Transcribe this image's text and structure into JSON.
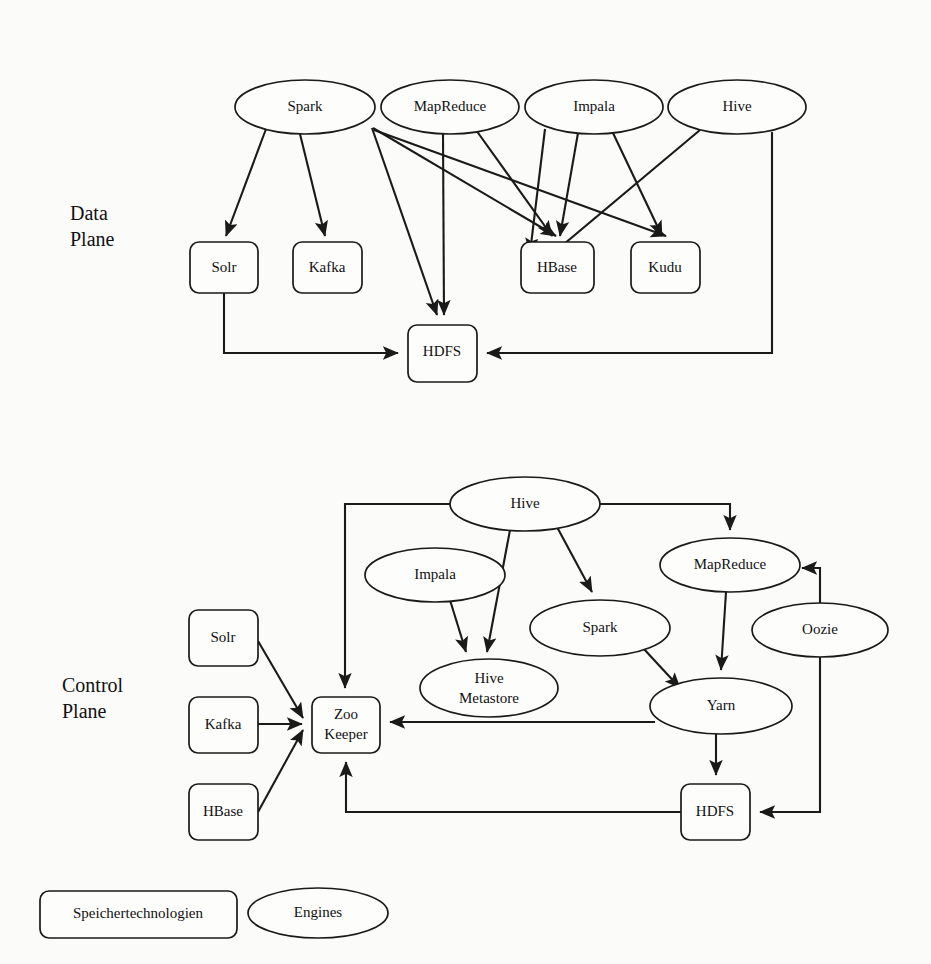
{
  "diagram": {
    "background_color": "#fbfbfa",
    "stroke_color": "#1a1a1a",
    "fill_color": "#fdfdfc"
  },
  "planes": [
    {
      "id": "data-plane",
      "label_line1": "Data",
      "label_line2": "Plane"
    },
    {
      "id": "control-plane",
      "label_line1": "Control",
      "label_line2": "Plane"
    }
  ],
  "legend": {
    "items": [
      {
        "shape": "rectangle",
        "label": "Speichertechnologien"
      },
      {
        "shape": "ellipse",
        "label": "Engines"
      }
    ]
  },
  "data_plane": {
    "engines": [
      {
        "id": "dp-spark",
        "label": "Spark",
        "cx": 305,
        "cy": 107,
        "rx": 70,
        "ry": 27
      },
      {
        "id": "dp-mapreduce",
        "label": "MapReduce",
        "cx": 450,
        "cy": 107,
        "rx": 69,
        "ry": 27
      },
      {
        "id": "dp-impala",
        "label": "Impala",
        "cx": 594,
        "cy": 107,
        "rx": 69,
        "ry": 27
      },
      {
        "id": "dp-hive",
        "label": "Hive",
        "cx": 737,
        "cy": 107,
        "rx": 69,
        "ry": 27
      }
    ],
    "storages": [
      {
        "id": "dp-solr",
        "label": "Solr",
        "x": 190,
        "y": 242,
        "w": 68,
        "h": 51
      },
      {
        "id": "dp-kafka",
        "label": "Kafka",
        "x": 293,
        "y": 242,
        "w": 69,
        "h": 51
      },
      {
        "id": "dp-hbase",
        "label": "HBase",
        "x": 521,
        "y": 242,
        "w": 73,
        "h": 51
      },
      {
        "id": "dp-kudu",
        "label": "Kudu",
        "x": 631,
        "y": 242,
        "w": 69,
        "h": 51
      },
      {
        "id": "dp-hdfs",
        "label": "HDFS",
        "x": 408,
        "y": 325,
        "w": 69,
        "h": 57
      }
    ],
    "edges": [
      {
        "from": "Spark",
        "to": "Solr"
      },
      {
        "from": "Spark",
        "to": "Kafka"
      },
      {
        "from": "Spark",
        "to": "HDFS"
      },
      {
        "from": "Spark",
        "to": "HBase"
      },
      {
        "from": "Spark",
        "to": "Kudu"
      },
      {
        "from": "MapReduce",
        "to": "HDFS"
      },
      {
        "from": "MapReduce",
        "to": "HBase"
      },
      {
        "from": "Impala",
        "to": "HBase"
      },
      {
        "from": "Impala",
        "to": "Kudu"
      },
      {
        "from": "Impala",
        "to": "HDFS"
      },
      {
        "from": "Hive",
        "to": "HBase"
      },
      {
        "from": "Hive",
        "to": "HDFS"
      },
      {
        "from": "Solr",
        "to": "HDFS"
      }
    ]
  },
  "control_plane": {
    "engines": [
      {
        "id": "cp-hive",
        "label": "Hive",
        "cx": 525,
        "cy": 504,
        "rx": 75,
        "ry": 27
      },
      {
        "id": "cp-impala",
        "label": "Impala",
        "cx": 435,
        "cy": 575,
        "rx": 70,
        "ry": 27
      },
      {
        "id": "cp-mapreduce",
        "label": "MapReduce",
        "cx": 730,
        "cy": 565,
        "rx": 70,
        "ry": 27
      },
      {
        "id": "cp-spark",
        "label": "Spark",
        "cx": 600,
        "cy": 628,
        "rx": 70,
        "ry": 28
      },
      {
        "id": "cp-oozie",
        "label": "Oozie",
        "cx": 820,
        "cy": 630,
        "rx": 68,
        "ry": 27
      },
      {
        "id": "cp-metastore",
        "label_line1": "Hive",
        "label_line2": "Metastore",
        "label": "Hive Metastore",
        "cx": 489,
        "cy": 688,
        "rx": 69,
        "ry": 29
      },
      {
        "id": "cp-yarn",
        "label": "Yarn",
        "cx": 721,
        "cy": 706,
        "rx": 71,
        "ry": 28
      }
    ],
    "storages": [
      {
        "id": "cp-solr",
        "label": "Solr",
        "x": 189,
        "y": 610,
        "w": 69,
        "h": 56
      },
      {
        "id": "cp-kafka",
        "label": "Kafka",
        "x": 189,
        "y": 697,
        "w": 69,
        "h": 56
      },
      {
        "id": "cp-hbase",
        "label": "HBase",
        "x": 189,
        "y": 784,
        "w": 69,
        "h": 56
      },
      {
        "id": "cp-zookeeper",
        "label_line1": "Zoo",
        "label_line2": "Keeper",
        "label": "Zoo Keeper",
        "x": 312,
        "y": 697,
        "w": 68,
        "h": 56
      },
      {
        "id": "cp-hdfs",
        "label": "HDFS",
        "x": 681,
        "y": 784,
        "w": 69,
        "h": 56
      }
    ],
    "edges": [
      {
        "from": "Hive",
        "to": "Zoo Keeper"
      },
      {
        "from": "Hive",
        "to": "Hive Metastore"
      },
      {
        "from": "Hive",
        "to": "Spark"
      },
      {
        "from": "Hive",
        "to": "MapReduce"
      },
      {
        "from": "Impala",
        "to": "Hive Metastore"
      },
      {
        "from": "MapReduce",
        "to": "Yarn"
      },
      {
        "from": "Spark",
        "to": "Yarn"
      },
      {
        "from": "Yarn",
        "to": "Zoo Keeper"
      },
      {
        "from": "Yarn",
        "to": "HDFS"
      },
      {
        "from": "Solr",
        "to": "Zoo Keeper"
      },
      {
        "from": "Kafka",
        "to": "Zoo Keeper"
      },
      {
        "from": "HBase",
        "to": "Zoo Keeper"
      },
      {
        "from": "HDFS",
        "to": "Zoo Keeper"
      },
      {
        "from": "Oozie",
        "to": "MapReduce"
      },
      {
        "from": "Oozie",
        "to": "HDFS"
      }
    ]
  }
}
